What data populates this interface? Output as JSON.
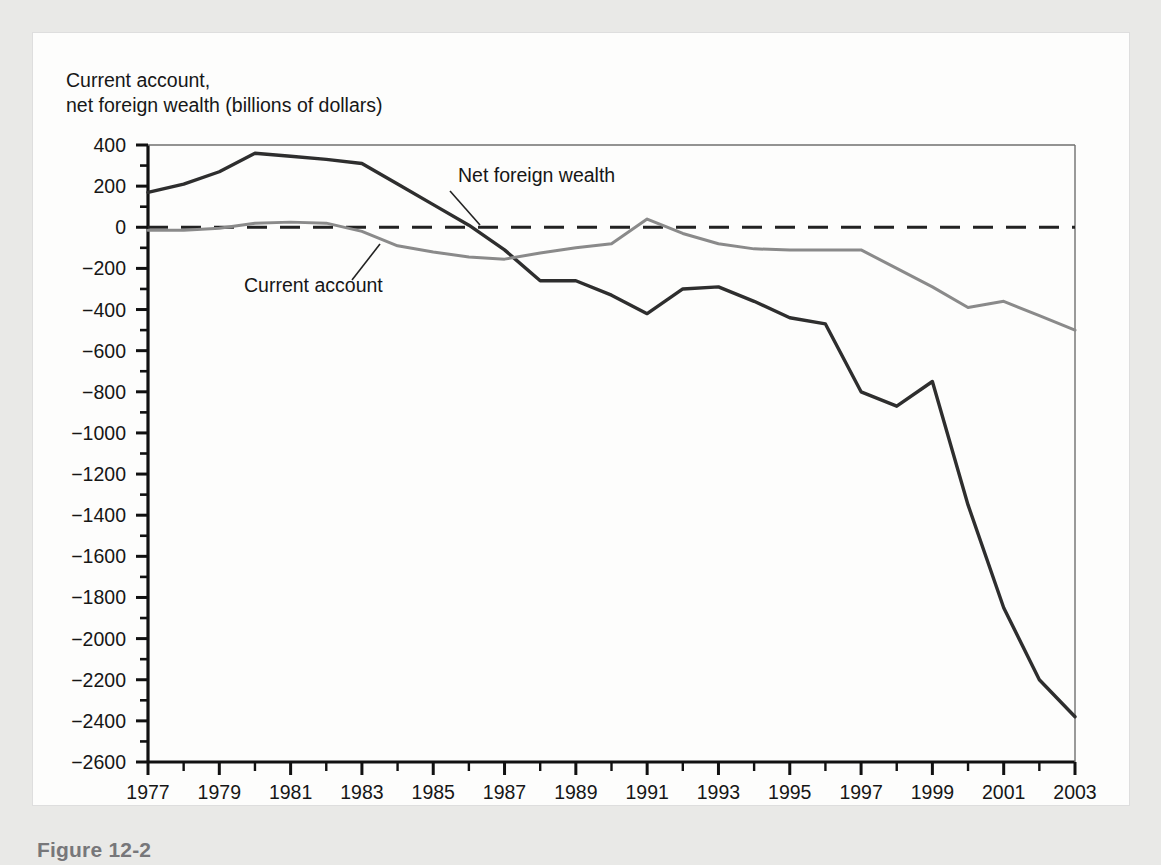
{
  "figure": {
    "caption": "Figure 12-2",
    "axis_title_line1": "Current account,",
    "axis_title_line2": "net foreign wealth (billions of dollars)"
  },
  "annotations": {
    "net_foreign_wealth_label": "Net foreign wealth",
    "current_account_label": "Current account"
  },
  "colors": {
    "net_foreign_wealth": "#2e2e2e",
    "current_account": "#8a8a8a",
    "axis": "#111111",
    "zero_line": "#222222",
    "caption": "#77777a",
    "panel_background": "#fdfdfc",
    "page_background": "#e9e9e7"
  },
  "chart_data": {
    "type": "line",
    "title": "",
    "subtitle": "",
    "xlabel": "",
    "ylabel": "Current account, net foreign wealth (billions of dollars)",
    "xlim": [
      1977,
      2003
    ],
    "ylim": [
      -2600,
      400
    ],
    "ytick_step": 200,
    "xtick_step": 1,
    "grid": false,
    "legend_position": "inline-annotation",
    "zero_reference_line": 0,
    "zero_reference_style": "dashed",
    "x": [
      1977,
      1978,
      1979,
      1980,
      1981,
      1982,
      1983,
      1984,
      1985,
      1986,
      1987,
      1988,
      1989,
      1990,
      1991,
      1992,
      1993,
      1994,
      1995,
      1996,
      1997,
      1998,
      1999,
      2000,
      2001,
      2002,
      2003
    ],
    "xtick_labels": [
      "1977",
      "",
      "1979",
      "",
      "1981",
      "",
      "1983",
      "",
      "1985",
      "",
      "1987",
      "",
      "1989",
      "",
      "1991",
      "",
      "1993",
      "",
      "1995",
      "",
      "1997",
      "",
      "1999",
      "",
      "2001",
      "",
      "2003"
    ],
    "ytick_labels": [
      "400",
      "200",
      "0",
      "-200",
      "-400",
      "-600",
      "-800",
      "-1000",
      "-1200",
      "-1400",
      "-1600",
      "-1800",
      "-2000",
      "-2200",
      "-2400",
      "-2600"
    ],
    "ytick_values": [
      400,
      200,
      0,
      -200,
      -400,
      -600,
      -800,
      -1000,
      -1200,
      -1400,
      -1600,
      -1800,
      -2000,
      -2200,
      -2400,
      -2600
    ],
    "series": [
      {
        "name": "Net foreign wealth",
        "color": "#2e2e2e",
        "width": 3.4,
        "values": [
          170,
          210,
          270,
          360,
          345,
          330,
          310,
          210,
          110,
          10,
          -110,
          -260,
          -260,
          -330,
          -420,
          -300,
          -290,
          -360,
          -440,
          -470,
          -800,
          -870,
          -750,
          -1350,
          -1850,
          -2200,
          -2380
        ]
      },
      {
        "name": "Current account",
        "color": "#8a8a8a",
        "width": 3.0,
        "values": [
          -15,
          -15,
          -5,
          20,
          25,
          20,
          -20,
          -90,
          -120,
          -145,
          -155,
          -125,
          -100,
          -80,
          40,
          -30,
          -80,
          -105,
          -110,
          -110,
          -110,
          -200,
          -290,
          -390,
          -360,
          -430,
          -500
        ]
      }
    ]
  }
}
